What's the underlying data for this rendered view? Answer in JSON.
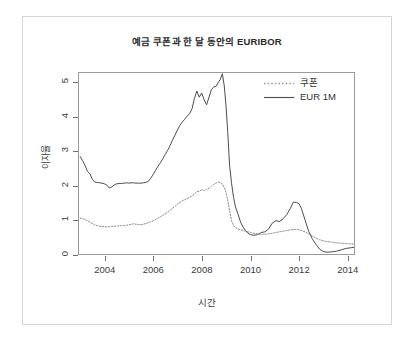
{
  "chart_data": {
    "type": "line",
    "title": "예금 쿠폰과 한 달 동안의 EURIBOR",
    "xlabel": "시간",
    "ylabel": "이자율",
    "xlim": [
      2002.9,
      2014.3
    ],
    "ylim": [
      0,
      5.3
    ],
    "grid": false,
    "legend_position": "top-right",
    "xticks": [
      "2004",
      "2006",
      "2008",
      "2010",
      "2012",
      "2014"
    ],
    "xtick_values": [
      2004,
      2006,
      2008,
      2010,
      2012,
      2014
    ],
    "yticks": [
      "0",
      "1",
      "2",
      "3",
      "4",
      "5"
    ],
    "ytick_values": [
      0,
      1,
      2,
      3,
      4,
      5
    ],
    "x": [
      2002.95,
      2003.05,
      2003.15,
      2003.25,
      2003.35,
      2003.45,
      2003.55,
      2003.65,
      2003.75,
      2003.85,
      2003.95,
      2004.05,
      2004.15,
      2004.25,
      2004.35,
      2004.45,
      2004.55,
      2004.65,
      2004.75,
      2004.85,
      2004.95,
      2005.05,
      2005.15,
      2005.25,
      2005.35,
      2005.45,
      2005.55,
      2005.65,
      2005.75,
      2005.85,
      2005.95,
      2006.05,
      2006.15,
      2006.25,
      2006.35,
      2006.45,
      2006.55,
      2006.65,
      2006.75,
      2006.85,
      2006.95,
      2007.05,
      2007.15,
      2007.25,
      2007.35,
      2007.45,
      2007.55,
      2007.65,
      2007.75,
      2007.85,
      2007.95,
      2008.05,
      2008.15,
      2008.25,
      2008.35,
      2008.45,
      2008.55,
      2008.65,
      2008.72,
      2008.8,
      2008.88,
      2008.95,
      2009.02,
      2009.1,
      2009.18,
      2009.26,
      2009.34,
      2009.45,
      2009.55,
      2009.65,
      2009.75,
      2009.85,
      2009.95,
      2010.1,
      2010.25,
      2010.4,
      2010.55,
      2010.7,
      2010.85,
      2011.0,
      2011.15,
      2011.3,
      2011.45,
      2011.6,
      2011.72,
      2011.85,
      2011.95,
      2012.05,
      2012.2,
      2012.35,
      2012.5,
      2012.65,
      2012.8,
      2012.95,
      2013.1,
      2013.3,
      2013.5,
      2013.7,
      2013.9,
      2014.1,
      2014.2
    ],
    "series": [
      {
        "name": "EUR 1M",
        "style": "solid",
        "color": "#4d4d4d",
        "values": [
          2.88,
          2.76,
          2.62,
          2.45,
          2.38,
          2.22,
          2.14,
          2.13,
          2.12,
          2.11,
          2.09,
          2.05,
          1.97,
          2.0,
          2.06,
          2.09,
          2.1,
          2.1,
          2.11,
          2.12,
          2.11,
          2.12,
          2.12,
          2.11,
          2.11,
          2.11,
          2.12,
          2.13,
          2.16,
          2.25,
          2.36,
          2.48,
          2.6,
          2.7,
          2.82,
          2.94,
          3.06,
          3.2,
          3.36,
          3.5,
          3.65,
          3.78,
          3.88,
          3.96,
          4.05,
          4.12,
          4.26,
          4.56,
          4.78,
          4.6,
          4.72,
          4.52,
          4.38,
          4.6,
          4.82,
          4.9,
          4.92,
          5.05,
          5.12,
          5.28,
          4.92,
          4.35,
          3.6,
          2.6,
          2.1,
          1.7,
          1.42,
          1.2,
          0.98,
          0.84,
          0.74,
          0.66,
          0.62,
          0.6,
          0.62,
          0.68,
          0.7,
          0.78,
          0.95,
          1.02,
          1.0,
          1.08,
          1.2,
          1.38,
          1.56,
          1.55,
          1.52,
          1.38,
          1.05,
          0.72,
          0.5,
          0.34,
          0.2,
          0.13,
          0.11,
          0.12,
          0.14,
          0.18,
          0.22,
          0.24,
          0.25
        ]
      },
      {
        "name": "쿠폰",
        "style": "dotted",
        "color": "#8c8c8c",
        "values": [
          1.1,
          1.08,
          1.06,
          1.02,
          0.98,
          0.94,
          0.9,
          0.88,
          0.86,
          0.85,
          0.85,
          0.84,
          0.85,
          0.86,
          0.86,
          0.87,
          0.87,
          0.88,
          0.88,
          0.89,
          0.9,
          0.92,
          0.93,
          0.92,
          0.91,
          0.91,
          0.92,
          0.94,
          0.96,
          0.99,
          1.02,
          1.06,
          1.1,
          1.14,
          1.18,
          1.22,
          1.27,
          1.32,
          1.38,
          1.44,
          1.5,
          1.55,
          1.6,
          1.63,
          1.66,
          1.7,
          1.74,
          1.8,
          1.86,
          1.88,
          1.92,
          1.9,
          1.92,
          1.96,
          2.02,
          2.08,
          2.12,
          2.14,
          2.12,
          2.08,
          1.98,
          1.84,
          1.62,
          1.3,
          1.02,
          0.88,
          0.82,
          0.78,
          0.76,
          0.74,
          0.72,
          0.7,
          0.68,
          0.66,
          0.64,
          0.63,
          0.63,
          0.64,
          0.66,
          0.68,
          0.7,
          0.72,
          0.74,
          0.76,
          0.77,
          0.77,
          0.76,
          0.74,
          0.7,
          0.64,
          0.58,
          0.52,
          0.47,
          0.44,
          0.42,
          0.4,
          0.38,
          0.37,
          0.36,
          0.35,
          0.35
        ]
      }
    ],
    "legend": [
      {
        "label": "쿠폰",
        "style": "dotted"
      },
      {
        "label": "EUR 1M",
        "style": "solid"
      }
    ]
  }
}
